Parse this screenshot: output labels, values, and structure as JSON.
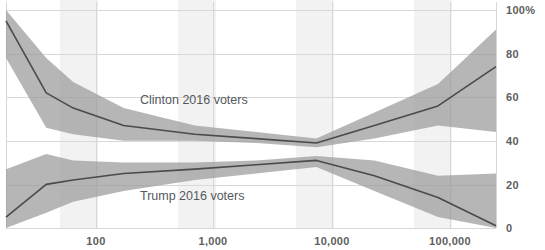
{
  "chart_data": {
    "type": "line",
    "title": "",
    "subtitle": "",
    "xlabel": "",
    "ylabel": "",
    "xscale": "log",
    "xlim": [
      28,
      300000
    ],
    "ylim": [
      0,
      100
    ],
    "grid": true,
    "legend_position": "inline-annotation",
    "x_tick_labels": [
      "100",
      "1,000",
      "10,000",
      "100,000"
    ],
    "x_tick_values": [
      100,
      1000,
      10000,
      100000
    ],
    "y_tick_labels": [
      "100%",
      "80",
      "60",
      "40",
      "20",
      "0"
    ],
    "y_tick_values": [
      100,
      80,
      60,
      40,
      20,
      0
    ],
    "annotations": [
      {
        "name": "clinton-label",
        "text": "Clinton 2016 voters",
        "x": 330,
        "y": 57
      },
      {
        "name": "trump-label",
        "text": "Trump 2016 voters",
        "x": 330,
        "y": 15
      }
    ],
    "series": [
      {
        "name": "Clinton 2016 voters",
        "color": "#4a4a4a",
        "band_color": "#9a9a9a",
        "x": [
          28,
          60,
          100,
          260,
          1000,
          3200,
          10000,
          30000,
          100000,
          300000
        ],
        "values": [
          95,
          62,
          55,
          47,
          43,
          41,
          39,
          47,
          56,
          74
        ],
        "band_low": [
          78,
          46,
          43,
          40,
          40,
          39,
          37,
          41,
          47,
          44
        ],
        "band_high": [
          100,
          78,
          67,
          55,
          47,
          44,
          41,
          53,
          66,
          91
        ]
      },
      {
        "name": "Trump 2016 voters",
        "color": "#4a4a4a",
        "band_color": "#9a9a9a",
        "x": [
          28,
          60,
          100,
          260,
          1000,
          3200,
          10000,
          30000,
          100000,
          300000
        ],
        "values": [
          5,
          20,
          22,
          25,
          27,
          29,
          31,
          24,
          14,
          1
        ],
        "band_low": [
          0,
          7,
          12,
          17,
          22,
          25,
          28,
          17,
          5,
          0
        ],
        "band_high": [
          27,
          34,
          31,
          30,
          30,
          31,
          33,
          31,
          24,
          25
        ]
      }
    ]
  },
  "axis": {
    "x_ticks": [
      {
        "label": "100",
        "px": 96
      },
      {
        "label": "1,000",
        "px": 213
      },
      {
        "label": "10,000",
        "px": 332
      },
      {
        "label": "100,000",
        "px": 450
      }
    ],
    "y_ticks": [
      {
        "label": "100%",
        "px": 10
      },
      {
        "label": "80",
        "px": 54
      },
      {
        "label": "60",
        "px": 97
      },
      {
        "label": "40",
        "px": 141
      },
      {
        "label": "20",
        "px": 185
      },
      {
        "label": "0",
        "px": 228
      }
    ]
  }
}
